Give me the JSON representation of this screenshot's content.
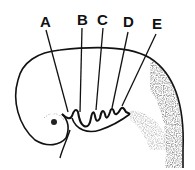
{
  "figure": {
    "labels": [
      {
        "id": "A",
        "text": "A",
        "x": 40,
        "y": 14
      },
      {
        "id": "B",
        "text": "B",
        "x": 77,
        "y": 12
      },
      {
        "id": "C",
        "text": "C",
        "x": 97,
        "y": 12
      },
      {
        "id": "D",
        "text": "D",
        "x": 123,
        "y": 14
      },
      {
        "id": "E",
        "text": "E",
        "x": 152,
        "y": 16
      }
    ],
    "ink_color": "#111111"
  }
}
